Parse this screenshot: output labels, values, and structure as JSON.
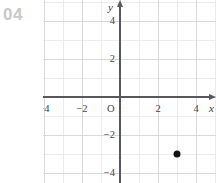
{
  "problem": {
    "number": "04",
    "number_color": "#c9c9c9"
  },
  "chart_data": {
    "type": "scatter",
    "title": "",
    "xlabel": "x",
    "ylabel": "y",
    "xlim": [
      -6,
      5
    ],
    "ylim": [
      -5,
      5
    ],
    "grid": true,
    "grid_major_step": 2,
    "grid_minor_step": 1,
    "legend": "none",
    "axis_color": "#58585c",
    "grid_color": "#d8d8dd",
    "grid_minor_color": "#ececed",
    "point_color": "#111111",
    "origin_label": "O",
    "x_tick_labels": [
      {
        "value": -4,
        "text": "−4"
      },
      {
        "value": -2,
        "text": "−2"
      },
      {
        "value": 2,
        "text": "2"
      },
      {
        "value": 4,
        "text": "4"
      }
    ],
    "y_tick_labels": [
      {
        "value": 4,
        "text": "4"
      },
      {
        "value": 2,
        "text": "2"
      },
      {
        "value": -2,
        "text": "−2"
      },
      {
        "value": -4,
        "text": "−4"
      }
    ],
    "points": [
      {
        "x": 3,
        "y": -3,
        "label": ""
      }
    ]
  }
}
